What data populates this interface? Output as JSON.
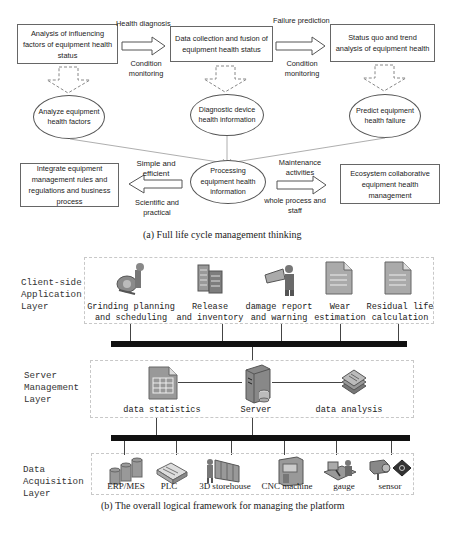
{
  "part_a": {
    "caption": "(a) Full life cycle management thinking",
    "top_boxes": [
      {
        "text": "Analysis of influencing factors of equipment health status"
      },
      {
        "text": "Data collection and fusion of equipment health status"
      },
      {
        "text": "Status quo and trend analysis of equipment health"
      }
    ],
    "top_arrow_labels": [
      {
        "above": "Health diagnosis",
        "below": "Condition monitoring"
      },
      {
        "above": "Failure prediction",
        "below": "Condition monitoring"
      }
    ],
    "ellipses": [
      {
        "text": "Analyze equipment health factors"
      },
      {
        "text": "Diagnostic device health information"
      },
      {
        "text": "Predict equipment health failure"
      }
    ],
    "center_ellipse": {
      "text": "Processing equipment health information"
    },
    "left_box": {
      "text": "Integrate equipment management rules and regulations and business process"
    },
    "right_box": {
      "text": "Ecosystem collaborative equipment health management"
    },
    "left_arrow_labels": {
      "above": "Simple and efficient",
      "below": "Scientific and practical"
    },
    "right_arrow_labels": {
      "above": "Maintenance activities",
      "below": "whole process and staff"
    }
  },
  "part_b": {
    "caption": "(b) The overall logical framework for managing the platform",
    "layers": [
      {
        "label": "Client-side\nApplication\nLayer",
        "items": [
          {
            "icon": "grinding-machine-icon",
            "label": "Grinding planning\nand scheduling"
          },
          {
            "icon": "inventory-building-icon",
            "label": "Release\nand inventory"
          },
          {
            "icon": "report-worker-icon",
            "label": "damage report\nand warning"
          },
          {
            "icon": "document-icon",
            "label": "Wear\nestimation"
          },
          {
            "icon": "document-icon",
            "label": "Residual life\ncalculation"
          }
        ]
      },
      {
        "label": "Server\nManagement\nLayer",
        "items": [
          {
            "icon": "spreadsheet-icon",
            "label": "data statistics"
          },
          {
            "icon": "server-icon",
            "label": "Server"
          },
          {
            "icon": "document-stack-icon",
            "label": "data analysis"
          }
        ]
      },
      {
        "label": "Data\nAcquisition\nLayer",
        "items": [
          {
            "icon": "database-icon",
            "label": "ERP/MES"
          },
          {
            "icon": "plc-icon",
            "label": "PLC"
          },
          {
            "icon": "storehouse-icon",
            "label": "3D storehouse"
          },
          {
            "icon": "cnc-machine-icon",
            "label": "CNC machine"
          },
          {
            "icon": "gauge-icon",
            "label": "gauge"
          },
          {
            "icon": "sensor-icon",
            "label": "sensor"
          }
        ]
      }
    ]
  },
  "colors": {
    "line": "#555555",
    "bus": "#111111",
    "dash": "#c8c8c8",
    "icon_gray": "#9a9a9a",
    "icon_dark": "#5a5a5a"
  }
}
